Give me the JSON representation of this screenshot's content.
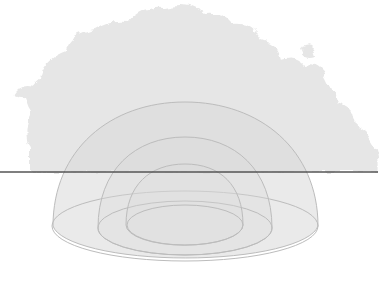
{
  "diagram": {
    "title": "",
    "elements": [
      {
        "id": "cloud",
        "kind": "cloud-silhouette"
      },
      {
        "id": "horizon",
        "kind": "ground-line"
      },
      {
        "id": "dome-outer",
        "kind": "hemisphere",
        "level": 3
      },
      {
        "id": "dome-middle",
        "kind": "hemisphere",
        "level": 2
      },
      {
        "id": "dome-inner",
        "kind": "hemisphere",
        "level": 1
      }
    ],
    "colors": {
      "background": "#ffffff",
      "cloud": "#e6e6e6",
      "dome_fill": "#d6d6d6",
      "dome_stroke": "#bdbdbd",
      "horizon": "#555555"
    }
  }
}
